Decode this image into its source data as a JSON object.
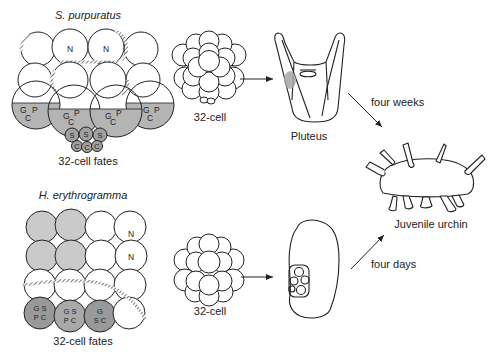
{
  "colors": {
    "stroke": "#222222",
    "light_gray": "#c8c8c8",
    "mid_gray": "#a8a8a8",
    "dark_gray": "#8f8f8f",
    "hatch": "#555555"
  },
  "top": {
    "species": "S. purpuratus",
    "fates_caption": "32-cell fates",
    "embryo_caption": "32-cell",
    "larva_caption": "Pluteus",
    "arrow_label": "four weeks",
    "cell_labels": {
      "animal": [
        "N",
        "N"
      ],
      "veg_cells": [
        {
          "g": "G",
          "p": "P",
          "c": "C"
        },
        {
          "g": "G",
          "p": "P",
          "c": "C"
        },
        {
          "g": "G",
          "p": "P",
          "c": "C"
        },
        {
          "g": "G",
          "p": "P",
          "c": "C"
        }
      ],
      "small_row1": [
        "S",
        "S",
        "S"
      ],
      "small_row2": [
        "C",
        "C",
        "C"
      ]
    }
  },
  "bottom": {
    "species": "H. erythrogramma",
    "fates_caption": "32-cell fates",
    "embryo_caption": "32-cell",
    "arrow_label": "four days",
    "cell_labels": {
      "n1": "N",
      "n2": "N",
      "veg": [
        {
          "l1": "G S",
          "l2": "P C"
        },
        {
          "l1": "G S",
          "l2": "P C"
        },
        {
          "l1": "G",
          "l2": "S C"
        }
      ]
    }
  },
  "outcome": {
    "caption": "Juvenile urchin"
  }
}
